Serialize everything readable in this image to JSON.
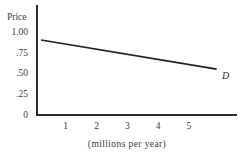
{
  "chart_data": {
    "type": "line",
    "title": "",
    "ylabel": "Price",
    "xlabel": "(millions per year)",
    "y_ticks": [
      "1.00",
      ".75",
      ".50",
      ".25",
      "0"
    ],
    "y_tick_values": [
      1.0,
      0.75,
      0.5,
      0.25,
      0
    ],
    "x_ticks": [
      "1",
      "2",
      "3",
      "4",
      "5"
    ],
    "x_tick_values": [
      1,
      2,
      3,
      4,
      5
    ],
    "xlim": [
      0,
      6.5
    ],
    "ylim": [
      0,
      1.3
    ],
    "grid": false,
    "legend_position": "none",
    "series": [
      {
        "name": "D",
        "label": "D",
        "points": [
          {
            "x": 0.2,
            "y": 0.9
          },
          {
            "x": 5.9,
            "y": 0.55
          }
        ]
      }
    ],
    "colors": {
      "ink": "#2b2b2b",
      "curve": "#1e1e1e",
      "background": "#ffffff"
    }
  }
}
